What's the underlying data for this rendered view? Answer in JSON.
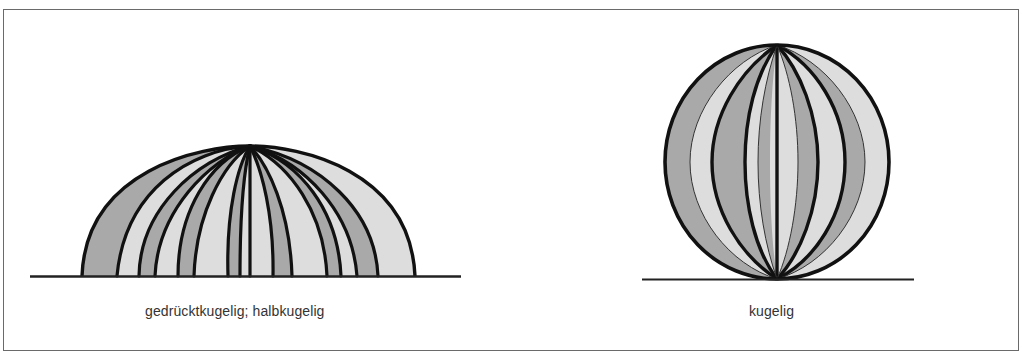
{
  "figure": {
    "panels": [
      {
        "id": "left",
        "shape": "dome",
        "caption": "gedrücktkugelig; halbkugelig"
      },
      {
        "id": "right",
        "shape": "sphere",
        "caption": "kugelig"
      }
    ],
    "colors": {
      "stripe_dark": "#a9a9a9",
      "stripe_light": "#dddddd",
      "outline": "#111111",
      "frame": "#6a6a6a"
    }
  }
}
